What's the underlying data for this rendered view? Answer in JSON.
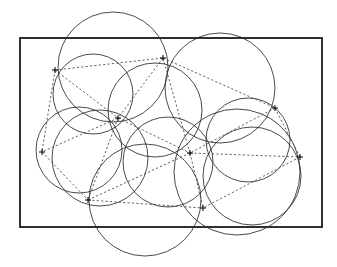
{
  "figure": {
    "width": 337,
    "height": 267,
    "background_color": "#ffffff"
  },
  "chart_data": {
    "type": "scatter",
    "subtitle": "",
    "xlabel": "",
    "ylabel": "",
    "grid": false,
    "legend": null,
    "xlim": [
      0,
      337
    ],
    "ylim": [
      0,
      267
    ]
  },
  "bounding_rect": {
    "label": "domain-boundary",
    "x": 20,
    "y": 38,
    "width": 302,
    "height": 189,
    "stroke": "#1a1a1a",
    "stroke_width": 1.8,
    "fill": "none"
  },
  "style": {
    "circle_stroke": "#2b2b2b",
    "circle_stroke_width": 0.85,
    "edge_stroke": "#3a3a3a",
    "edge_stroke_width": 0.8,
    "edge_dash": "2.2 2.2",
    "marker_stroke": "#111111",
    "marker_stroke_width": 1.1,
    "marker_size": 6
  },
  "sites": [
    {
      "id": "p0",
      "name": "site-upper-left",
      "x": 55,
      "y": 70
    },
    {
      "id": "p1",
      "name": "site-top-center",
      "x": 163,
      "y": 58
    },
    {
      "id": "p2",
      "name": "site-hub-left",
      "x": 118,
      "y": 118
    },
    {
      "id": "p3",
      "name": "site-right-upper",
      "x": 275,
      "y": 108
    },
    {
      "id": "p4",
      "name": "site-mid-left",
      "x": 42,
      "y": 152
    },
    {
      "id": "p5",
      "name": "site-hub-center",
      "x": 190,
      "y": 153
    },
    {
      "id": "p6",
      "name": "site-right-middle",
      "x": 300,
      "y": 157
    },
    {
      "id": "p7",
      "name": "site-bottom-left",
      "x": 88,
      "y": 200
    },
    {
      "id": "p8",
      "name": "site-bottom-center",
      "x": 203,
      "y": 208
    }
  ],
  "circumcircles": [
    {
      "id": "c0",
      "name": "circumcircle-top-left-large",
      "cx": 113,
      "cy": 67,
      "r": 55
    },
    {
      "id": "c1",
      "name": "circumcircle-top-right-large",
      "cx": 220,
      "cy": 88,
      "r": 55
    },
    {
      "id": "c2",
      "name": "circumcircle-bottom-large",
      "cx": 145,
      "cy": 200,
      "r": 56
    },
    {
      "id": "c3",
      "name": "circumcircle-upper-left-small",
      "cx": 93,
      "cy": 94,
      "r": 40
    },
    {
      "id": "c4",
      "name": "circumcircle-left-mid",
      "cx": 79,
      "cy": 150,
      "r": 43
    },
    {
      "id": "c5",
      "name": "circumcircle-center-upper",
      "cx": 155,
      "cy": 110,
      "r": 47
    },
    {
      "id": "c6",
      "name": "circumcircle-center-lower",
      "cx": 168,
      "cy": 162,
      "r": 45
    },
    {
      "id": "c7",
      "name": "circumcircle-right-mid",
      "cx": 248,
      "cy": 140,
      "r": 42
    },
    {
      "id": "c8",
      "name": "circumcircle-right-lower",
      "cx": 252,
      "cy": 176,
      "r": 49
    },
    {
      "id": "c9",
      "name": "circumcircle-bottom-right",
      "cx": 237,
      "cy": 172,
      "r": 63
    },
    {
      "id": "c10",
      "name": "circumcircle-left-lower-small",
      "cx": 100,
      "cy": 158,
      "r": 48
    }
  ],
  "edges": [
    {
      "name": "edge-p0-p1",
      "from": "p0",
      "to": "p1"
    },
    {
      "name": "edge-p0-p2",
      "from": "p0",
      "to": "p2"
    },
    {
      "name": "edge-p0-p4",
      "from": "p0",
      "to": "p4"
    },
    {
      "name": "edge-p1-p2",
      "from": "p1",
      "to": "p2"
    },
    {
      "name": "edge-p1-p3",
      "from": "p1",
      "to": "p3"
    },
    {
      "name": "edge-p1-p5",
      "from": "p1",
      "to": "p5"
    },
    {
      "name": "edge-p2-p4",
      "from": "p2",
      "to": "p4"
    },
    {
      "name": "edge-p2-p5",
      "from": "p2",
      "to": "p5"
    },
    {
      "name": "edge-p2-p7",
      "from": "p2",
      "to": "p7"
    },
    {
      "name": "edge-p3-p5",
      "from": "p3",
      "to": "p5"
    },
    {
      "name": "edge-p3-p6",
      "from": "p3",
      "to": "p6"
    },
    {
      "name": "edge-p4-p7",
      "from": "p4",
      "to": "p7"
    },
    {
      "name": "edge-p5-p6",
      "from": "p5",
      "to": "p6"
    },
    {
      "name": "edge-p5-p7",
      "from": "p5",
      "to": "p7"
    },
    {
      "name": "edge-p5-p8",
      "from": "p5",
      "to": "p8"
    },
    {
      "name": "edge-p6-p8",
      "from": "p6",
      "to": "p8"
    },
    {
      "name": "edge-p7-p8",
      "from": "p7",
      "to": "p8"
    }
  ]
}
